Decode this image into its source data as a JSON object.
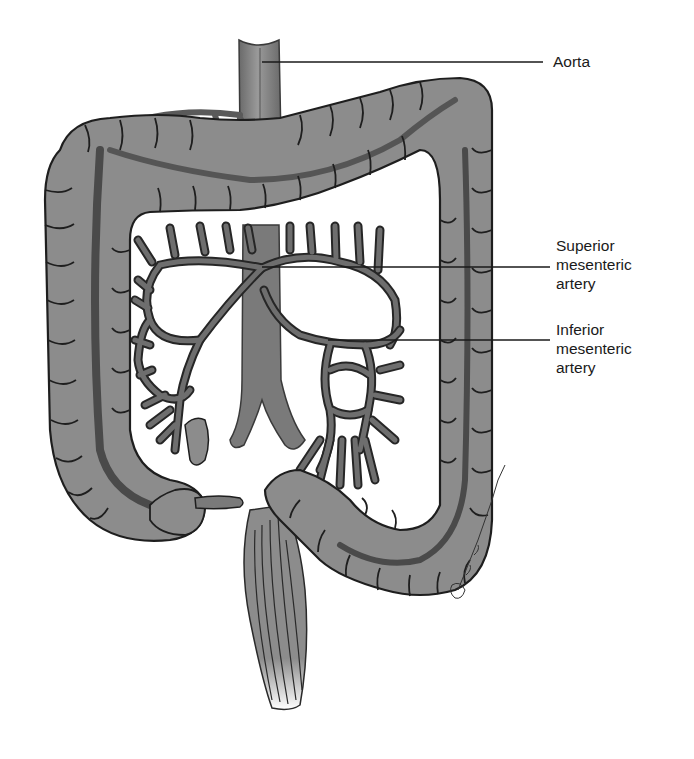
{
  "figure": {
    "type": "anatomical-illustration",
    "colors": {
      "tissue_fill": "#8c8c8c",
      "tissue_light": "#a3a3a3",
      "vessel_fill": "#5e5e5e",
      "outline": "#1e1e1e",
      "background": "#ffffff"
    }
  },
  "labels": {
    "aorta": "Aorta",
    "superior": "Superior\nmesenteric\nartery",
    "inferior": "Inferior\nmesenteric\nartery"
  }
}
